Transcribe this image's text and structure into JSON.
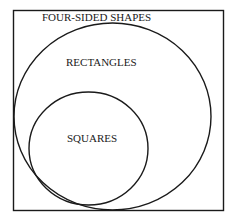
{
  "diagram": {
    "type": "venn",
    "colors": {
      "stroke": "#1a1a1a",
      "background": "#ffffff"
    },
    "sets": [
      {
        "id": "universe",
        "label": "FOUR-SIDED SHAPES",
        "shape": "rectangle"
      },
      {
        "id": "rectangles",
        "label": "RECTANGLES",
        "shape": "ellipse",
        "subset_of": "universe"
      },
      {
        "id": "squares",
        "label": "SQUARES",
        "shape": "ellipse",
        "subset_of": "rectangles"
      }
    ]
  }
}
